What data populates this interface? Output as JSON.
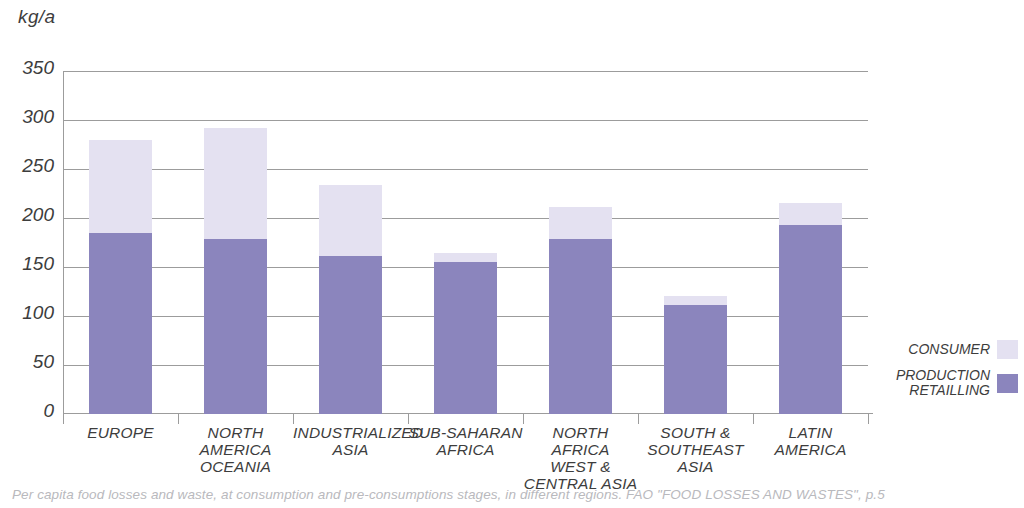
{
  "chart_data": {
    "type": "bar",
    "stacked": true,
    "title": "",
    "xlabel": "",
    "ylabel": "kg/a",
    "ylim": [
      0,
      350
    ],
    "ytick_step": 50,
    "yticks": [
      "350",
      "300",
      "250",
      "200",
      "150",
      "100",
      "50",
      "0"
    ],
    "grid": true,
    "legend_position": "right",
    "categories": [
      "EUROPE",
      "NORTH AMERICA\nOCEANIA",
      "INDUSTRIALIZED\nASIA",
      "SUB-SAHARAN\nAFRICA",
      "NORTH AFRICA\nWEST &\nCENTRAL ASIA",
      "SOUTH &\nSOUTHEAST\nASIA",
      "LATIN AMERICA"
    ],
    "series": [
      {
        "name": "PRODUCTION\nRETAILLING",
        "color": "#8b85bd",
        "values": [
          185,
          179,
          161,
          155,
          179,
          111,
          193
        ]
      },
      {
        "name": "CONSUMER",
        "color": "#e4e1f1",
        "values": [
          95,
          113,
          73,
          9,
          32,
          9,
          22
        ]
      }
    ],
    "totals": [
      280,
      292,
      234,
      164,
      211,
      120,
      215
    ]
  },
  "axis": {
    "unit_label": "kg/a"
  },
  "legend": {
    "items": [
      {
        "label": "CONSUMER",
        "color": "#e4e1f1"
      },
      {
        "label": "PRODUCTION\nRETAILLING",
        "color": "#8b85bd"
      }
    ]
  },
  "caption": {
    "text": "Per capita food losses and waste, at consumption and pre-consumptions stages, in different regions. FAO \"FOOD LOSSES AND WASTES\", p.5"
  }
}
